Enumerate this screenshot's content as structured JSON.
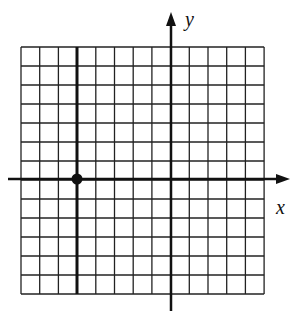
{
  "graph": {
    "x_axis_label": "x",
    "y_axis_label": "y",
    "grid": {
      "columns": 13,
      "rows": 13,
      "left": 21,
      "top": 47,
      "cell_w": 18.7,
      "cell_h": 19
    },
    "x_axis": {
      "y": 179,
      "x_start": 8,
      "x_end": 290
    },
    "y_axis": {
      "x": 171,
      "y_start": 12,
      "y_end": 311
    },
    "thick_vertical_line": {
      "x": 77,
      "y_start": 47,
      "y_end": 294
    },
    "point": {
      "x": 77,
      "y": 179,
      "grid_x": -5,
      "grid_y": 0
    },
    "colors": {
      "line": "#111111",
      "background": "#ffffff"
    }
  }
}
